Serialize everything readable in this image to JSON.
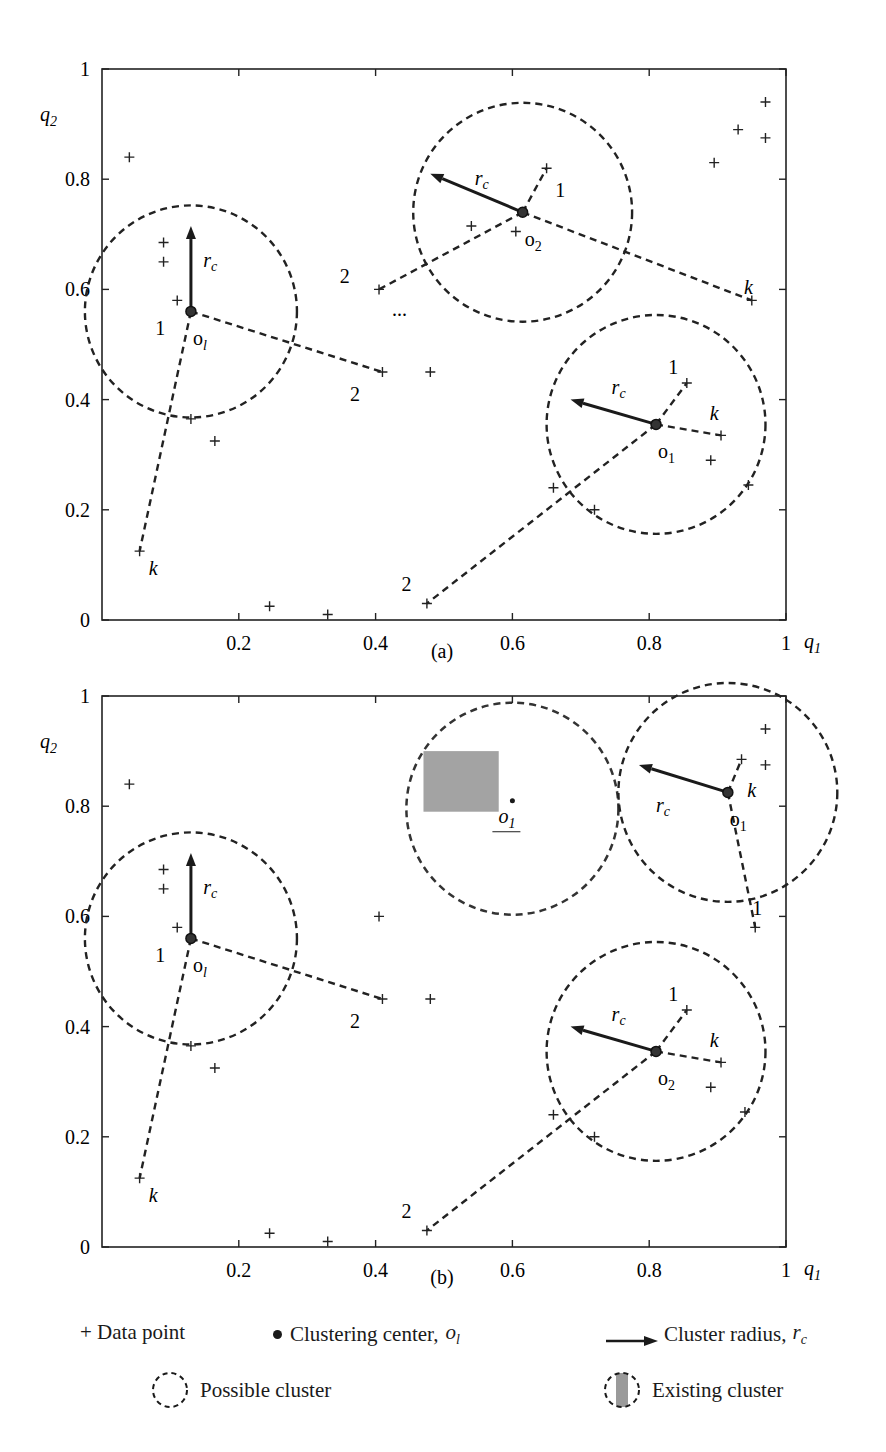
{
  "figure": {
    "legend": {
      "data_point": "+ Data point",
      "clustering_center": "Clustering center,",
      "clustering_center_symbol": "o",
      "clustering_center_sub": "l",
      "cluster_radius": "Cluster radius,",
      "cluster_radius_symbol": "r",
      "cluster_radius_sub": "c",
      "possible_cluster": "Possible cluster",
      "existing_cluster": "Existing cluster"
    }
  },
  "chart_data": [
    {
      "type": "scatter",
      "panel": "(a)",
      "xlabel": "q1",
      "ylabel": "q2",
      "xlim": [
        0,
        1
      ],
      "ylim": [
        0,
        1
      ],
      "xticks": [
        "0.2",
        "0.4",
        "0.6",
        "0.8",
        "1"
      ],
      "yticks": [
        "0",
        "0.2",
        "0.4",
        "0.6",
        "0.8",
        "1"
      ],
      "grid": false,
      "points": [
        [
          0.04,
          0.84
        ],
        [
          0.09,
          0.685
        ],
        [
          0.09,
          0.65
        ],
        [
          0.11,
          0.58
        ],
        [
          0.13,
          0.365
        ],
        [
          0.165,
          0.325
        ],
        [
          0.055,
          0.125
        ],
        [
          0.245,
          0.025
        ],
        [
          0.33,
          0.01
        ],
        [
          0.405,
          0.6
        ],
        [
          0.41,
          0.45
        ],
        [
          0.48,
          0.45
        ],
        [
          0.475,
          0.03
        ],
        [
          0.54,
          0.715
        ],
        [
          0.605,
          0.705
        ],
        [
          0.65,
          0.82
        ],
        [
          0.66,
          0.24
        ],
        [
          0.72,
          0.2
        ],
        [
          0.855,
          0.43
        ],
        [
          0.895,
          0.83
        ],
        [
          0.89,
          0.29
        ],
        [
          0.905,
          0.335
        ],
        [
          0.93,
          0.89
        ],
        [
          0.945,
          0.245
        ],
        [
          0.95,
          0.58
        ],
        [
          0.97,
          0.94
        ],
        [
          0.97,
          0.875
        ]
      ],
      "clusters": [
        {
          "kind": "possible",
          "center": [
            0.13,
            0.56
          ],
          "label": "o_l",
          "radius": 0.155,
          "arrow_to": [
            0.13,
            0.715
          ],
          "rc_label_at": [
            0.148,
            0.64
          ]
        },
        {
          "kind": "possible",
          "center": [
            0.615,
            0.74
          ],
          "label": "o_2",
          "radius": 0.16,
          "arrow_to": [
            0.48,
            0.81
          ],
          "rc_label_at": [
            0.545,
            0.79
          ]
        },
        {
          "kind": "possible",
          "center": [
            0.81,
            0.355
          ],
          "label": "o_1",
          "radius": 0.16,
          "arrow_to": [
            0.685,
            0.4
          ],
          "rc_label_at": [
            0.745,
            0.41
          ]
        }
      ],
      "distance_lines": [
        {
          "from": [
            0.13,
            0.56
          ],
          "to": [
            0.41,
            0.45
          ],
          "label": "2",
          "label_at": [
            0.37,
            0.41
          ]
        },
        {
          "from": [
            0.13,
            0.56
          ],
          "to": [
            0.055,
            0.125
          ],
          "label": "k",
          "label_at": [
            0.075,
            0.095
          ]
        },
        {
          "from": [
            0.615,
            0.74
          ],
          "to": [
            0.65,
            0.82
          ],
          "label": "1",
          "label_at": [
            0.67,
            0.78
          ]
        },
        {
          "from": [
            0.615,
            0.74
          ],
          "to": [
            0.405,
            0.6
          ],
          "label": "2",
          "label_at": [
            0.355,
            0.625
          ]
        },
        {
          "from": [
            0.615,
            0.74
          ],
          "to": [
            0.95,
            0.58
          ],
          "label": "k",
          "label_at": [
            0.945,
            0.605
          ]
        },
        {
          "from": [
            0.81,
            0.355
          ],
          "to": [
            0.855,
            0.43
          ],
          "label": "1",
          "label_at": [
            0.835,
            0.46
          ]
        },
        {
          "from": [
            0.81,
            0.355
          ],
          "to": [
            0.905,
            0.335
          ],
          "label": "k",
          "label_at": [
            0.895,
            0.375
          ]
        },
        {
          "from": [
            0.81,
            0.355
          ],
          "to": [
            0.475,
            0.03
          ],
          "label": "2",
          "label_at": [
            0.445,
            0.065
          ]
        }
      ],
      "labels_extra": [
        {
          "text": "1",
          "at": [
            0.085,
            0.53
          ]
        },
        {
          "text": "...",
          "at": [
            0.435,
            0.565
          ]
        }
      ]
    },
    {
      "type": "scatter",
      "panel": "(b)",
      "xlabel": "q1",
      "ylabel": "q2",
      "xlim": [
        0,
        1
      ],
      "ylim": [
        0,
        1
      ],
      "xticks": [
        "0.2",
        "0.4",
        "0.6",
        "0.8",
        "1"
      ],
      "yticks": [
        "0",
        "0.2",
        "0.4",
        "0.6",
        "0.8",
        "1"
      ],
      "grid": false,
      "points": [
        [
          0.04,
          0.84
        ],
        [
          0.09,
          0.685
        ],
        [
          0.09,
          0.65
        ],
        [
          0.11,
          0.58
        ],
        [
          0.13,
          0.365
        ],
        [
          0.165,
          0.325
        ],
        [
          0.055,
          0.125
        ],
        [
          0.245,
          0.025
        ],
        [
          0.33,
          0.01
        ],
        [
          0.405,
          0.6
        ],
        [
          0.41,
          0.45
        ],
        [
          0.48,
          0.45
        ],
        [
          0.475,
          0.03
        ],
        [
          0.66,
          0.24
        ],
        [
          0.72,
          0.2
        ],
        [
          0.855,
          0.43
        ],
        [
          0.89,
          0.29
        ],
        [
          0.905,
          0.335
        ],
        [
          0.94,
          0.245
        ],
        [
          0.935,
          0.885
        ],
        [
          0.97,
          0.875
        ],
        [
          0.97,
          0.94
        ],
        [
          0.955,
          0.58
        ]
      ],
      "existing_cluster": {
        "center": [
          0.6,
          0.81
        ],
        "label": "o'_1",
        "radius": 0.155,
        "box": [
          0.47,
          0.58,
          0.79,
          0.9
        ]
      },
      "clusters": [
        {
          "kind": "possible",
          "center": [
            0.13,
            0.56
          ],
          "label": "o_l",
          "radius": 0.155,
          "arrow_to": [
            0.13,
            0.715
          ],
          "rc_label_at": [
            0.148,
            0.64
          ]
        },
        {
          "kind": "possible",
          "center": [
            0.915,
            0.825
          ],
          "label": "o_1",
          "radius": 0.16,
          "arrow_to": [
            0.785,
            0.875
          ],
          "rc_label_at": [
            0.81,
            0.79
          ]
        },
        {
          "kind": "possible",
          "center": [
            0.81,
            0.355
          ],
          "label": "o_2",
          "radius": 0.16,
          "arrow_to": [
            0.685,
            0.4
          ],
          "rc_label_at": [
            0.745,
            0.41
          ]
        }
      ],
      "distance_lines": [
        {
          "from": [
            0.13,
            0.56
          ],
          "to": [
            0.41,
            0.45
          ],
          "label": "2",
          "label_at": [
            0.37,
            0.41
          ]
        },
        {
          "from": [
            0.13,
            0.56
          ],
          "to": [
            0.055,
            0.125
          ],
          "label": "k",
          "label_at": [
            0.075,
            0.095
          ]
        },
        {
          "from": [
            0.915,
            0.825
          ],
          "to": [
            0.935,
            0.885
          ],
          "label": "k",
          "label_at": [
            0.95,
            0.83
          ]
        },
        {
          "from": [
            0.915,
            0.825
          ],
          "to": [
            0.955,
            0.58
          ],
          "label": "1",
          "label_at": [
            0.958,
            0.615
          ]
        },
        {
          "from": [
            0.81,
            0.355
          ],
          "to": [
            0.855,
            0.43
          ],
          "label": "1",
          "label_at": [
            0.835,
            0.46
          ]
        },
        {
          "from": [
            0.81,
            0.355
          ],
          "to": [
            0.905,
            0.335
          ],
          "label": "k",
          "label_at": [
            0.895,
            0.375
          ]
        },
        {
          "from": [
            0.81,
            0.355
          ],
          "to": [
            0.475,
            0.03
          ],
          "label": "2",
          "label_at": [
            0.445,
            0.065
          ]
        }
      ],
      "labels_extra": [
        {
          "text": "1",
          "at": [
            0.085,
            0.53
          ]
        }
      ]
    }
  ]
}
